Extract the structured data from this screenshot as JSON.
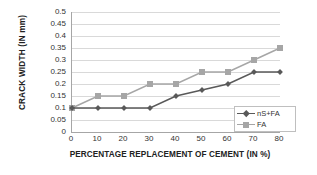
{
  "chart_data": {
    "type": "line",
    "title": "",
    "xlabel": "PERCENTAGE REPLACEMENT OF CEMENT  (IN %)",
    "ylabel": "CRACK WIDTH (IN mm)",
    "x": [
      0,
      10,
      20,
      30,
      40,
      50,
      60,
      70,
      80
    ],
    "xlim": [
      0,
      80
    ],
    "ylim": [
      0,
      0.5
    ],
    "grid": true,
    "legend_position": "bottom-right",
    "xticklabels": [
      "0",
      "10",
      "20",
      "30",
      "40",
      "50",
      "60",
      "70",
      "80"
    ],
    "yticklabels": [
      "0",
      "0.05",
      "0.1",
      "0.15",
      "0.2",
      "0.25",
      "0.3",
      "0.35",
      "0.4",
      "0.45",
      "0.5"
    ],
    "ytickvalues": [
      0,
      0.05,
      0.1,
      0.15,
      0.2,
      0.25,
      0.3,
      0.35,
      0.4,
      0.45,
      0.5
    ],
    "series": [
      {
        "name": "nS+FA",
        "color": "#595959",
        "marker": "diamond",
        "values": [
          0.1,
          0.1,
          0.1,
          0.1,
          0.15,
          0.175,
          0.2,
          0.25,
          0.25
        ]
      },
      {
        "name": "FA",
        "color": "#a6a6a6",
        "marker": "square",
        "values": [
          0.1,
          0.15,
          0.15,
          0.2,
          0.2,
          0.25,
          0.25,
          0.3,
          0.35
        ]
      }
    ]
  },
  "axes": {
    "y_title": "CRACK WIDTH (IN mm)",
    "x_title": "PERCENTAGE REPLACEMENT OF CEMENT  (IN %)"
  },
  "legend": {
    "entries": [
      {
        "label": "nS+FA",
        "color": "#595959"
      },
      {
        "label": "FA",
        "color": "#a6a6a6"
      }
    ]
  },
  "colors": {
    "gridline": "#d9d9d9",
    "axis": "#a6a6a6",
    "series_ns_fa": "#595959",
    "series_fa": "#a6a6a6",
    "background": "#ffffff"
  }
}
